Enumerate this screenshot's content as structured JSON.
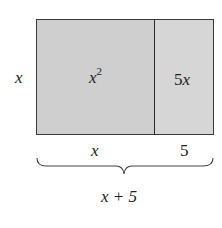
{
  "diagram": {
    "side_label": "x",
    "regions": [
      {
        "label_base": "x",
        "label_exp": "2",
        "label": "x^2",
        "width_label": "x"
      },
      {
        "label": "5x",
        "width_label": "5"
      }
    ],
    "total_width_label": "x + 5",
    "colors": {
      "fill": "#cfcfcf",
      "border": "#3a3a3a"
    }
  }
}
